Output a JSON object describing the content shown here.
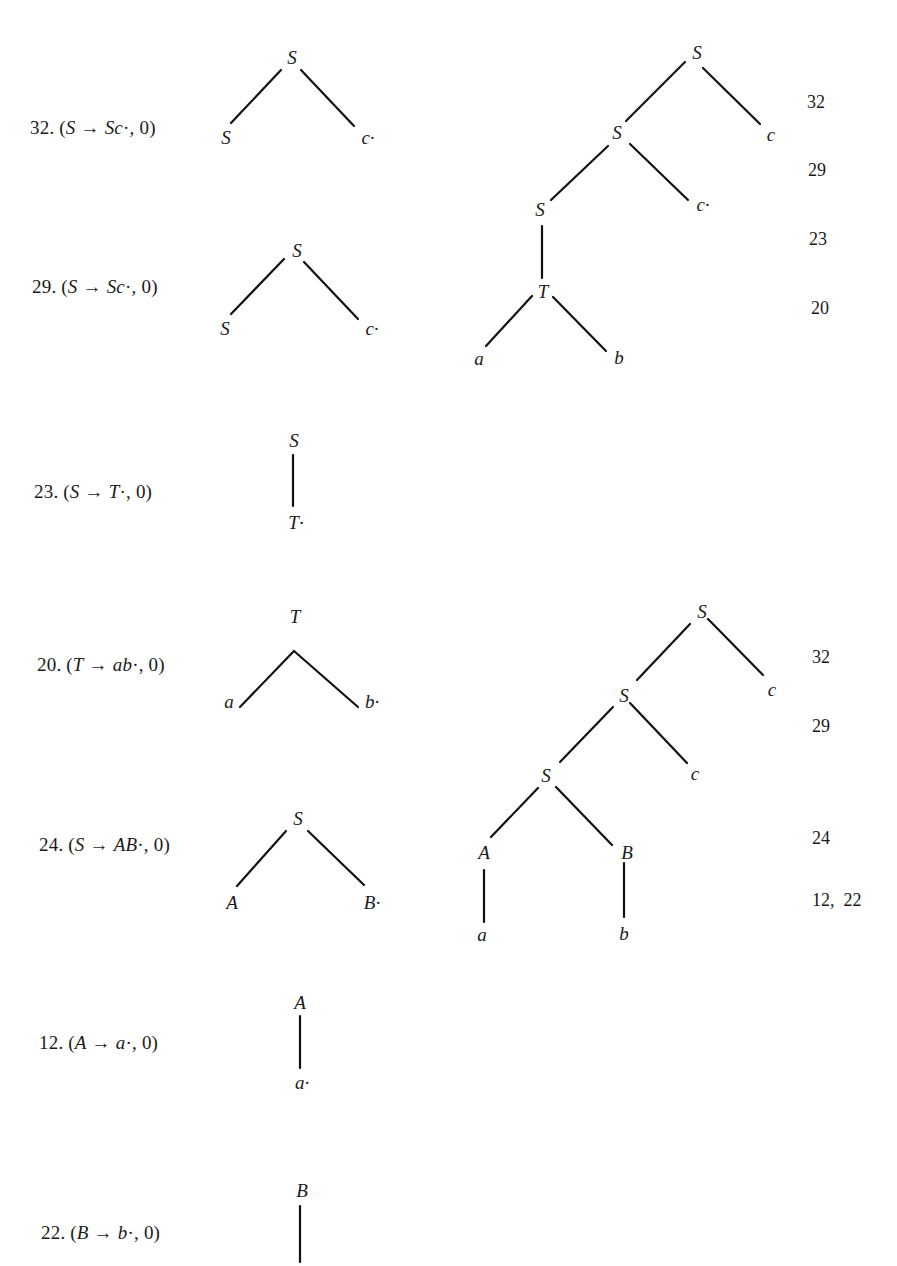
{
  "items": [
    {
      "number": "32.",
      "lhs": "S",
      "rhs": "Sc",
      "origin": "0",
      "tree_root": "S",
      "tree_children": [
        "S",
        "c·"
      ]
    },
    {
      "number": "29.",
      "lhs": "S",
      "rhs": "Sc",
      "origin": "0",
      "tree_root": "S",
      "tree_children": [
        "S",
        "c·"
      ]
    },
    {
      "number": "23.",
      "lhs": "S",
      "rhs": "T",
      "origin": "0",
      "tree_root": "S",
      "tree_children": [
        "T·"
      ]
    },
    {
      "number": "20.",
      "lhs": "T",
      "rhs": "ab",
      "origin": "0",
      "tree_root": "T",
      "tree_children": [
        "a",
        "b·"
      ]
    },
    {
      "number": "24.",
      "lhs": "S",
      "rhs": "AB",
      "origin": "0",
      "tree_root": "S",
      "tree_children": [
        "A",
        "B·"
      ]
    },
    {
      "number": "12.",
      "lhs": "A",
      "rhs": "a",
      "origin": "0",
      "tree_root": "A",
      "tree_children": [
        "a·"
      ]
    },
    {
      "number": "22.",
      "lhs": "B",
      "rhs": "b",
      "origin": "0",
      "tree_root": "B",
      "tree_children": []
    }
  ],
  "symbols": {
    "arrow": "→",
    "dot": "·",
    "open": "(",
    "close": ")",
    "comma": ","
  },
  "tree1": {
    "nodes": {
      "s1": "S",
      "c1": "c",
      "s2": "S",
      "c2": "c·",
      "s3": "S",
      "t": "T",
      "a": "a",
      "b": "b"
    },
    "steps": [
      "32",
      "29",
      "23",
      "20"
    ]
  },
  "tree2": {
    "nodes": {
      "s1": "S",
      "c1": "c",
      "s2": "S",
      "c2": "c",
      "s3": "S",
      "A": "A",
      "B": "B",
      "a": "a",
      "b": "b"
    },
    "steps": [
      "32",
      "29",
      "24",
      "12,  22"
    ]
  }
}
